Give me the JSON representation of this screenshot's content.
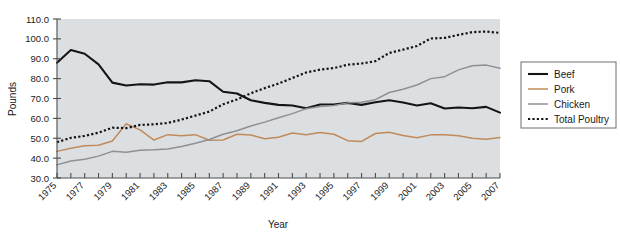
{
  "chart_data": {
    "type": "line",
    "title": "",
    "xlabel": "Year",
    "ylabel": "Pounds",
    "grid": false,
    "legend_position": "right",
    "xlim": [
      1975,
      2007
    ],
    "ylim": [
      30.0,
      110.0
    ],
    "ytick_step": 10.0,
    "ytick_labels": [
      "30.0",
      "40.0",
      "50.0",
      "60.0",
      "70.0",
      "80.0",
      "90.0",
      "100.0",
      "110.0"
    ],
    "ytick_values": [
      30.0,
      40.0,
      50.0,
      60.0,
      70.0,
      80.0,
      90.0,
      100.0,
      110.0
    ],
    "xtick_values": [
      1975,
      1976,
      1977,
      1978,
      1979,
      1980,
      1981,
      1982,
      1983,
      1984,
      1985,
      1986,
      1987,
      1988,
      1989,
      1990,
      1991,
      1992,
      1993,
      1994,
      1995,
      1996,
      1997,
      1998,
      1999,
      2000,
      2001,
      2002,
      2003,
      2004,
      2005,
      2006,
      2007
    ],
    "xtick_labels": [
      "1975",
      "",
      "1977",
      "",
      "1979",
      "",
      "1981",
      "",
      "1983",
      "",
      "1985",
      "",
      "1987",
      "",
      "1989",
      "",
      "1991",
      "",
      "1993",
      "",
      "1995",
      "",
      "1997",
      "",
      "1999",
      "",
      "2001",
      "",
      "2003",
      "",
      "2005",
      "",
      "2007"
    ],
    "x": [
      1975,
      1976,
      1977,
      1978,
      1979,
      1980,
      1981,
      1982,
      1983,
      1984,
      1985,
      1986,
      1987,
      1988,
      1989,
      1990,
      1991,
      1992,
      1993,
      1994,
      1995,
      1996,
      1997,
      1998,
      1999,
      2000,
      2001,
      2002,
      2003,
      2004,
      2005,
      2006,
      2007
    ],
    "series": [
      {
        "name": "Beef",
        "color": "#141414",
        "style": "solid",
        "width": 2.1,
        "values": [
          88.0,
          94.4,
          92.5,
          87.2,
          78.0,
          76.5,
          77.2,
          77.0,
          78.2,
          78.1,
          79.2,
          78.7,
          73.4,
          72.5,
          69.1,
          67.8,
          66.8,
          66.5,
          65.1,
          67.0,
          67.0,
          67.8,
          66.8,
          68.1,
          69.1,
          68.0,
          66.5,
          67.6,
          65.0,
          65.5,
          65.1,
          65.8,
          62.9
        ]
      },
      {
        "name": "Pork",
        "color": "#c08a5a",
        "style": "solid",
        "width": 1.5,
        "values": [
          43.4,
          45.0,
          46.2,
          46.5,
          48.6,
          57.3,
          54.2,
          49.1,
          51.8,
          51.2,
          51.8,
          49.0,
          49.1,
          52.0,
          51.6,
          49.8,
          50.5,
          52.6,
          51.8,
          52.9,
          52.0,
          48.8,
          48.4,
          52.4,
          53.0,
          51.4,
          50.3,
          51.7,
          51.7,
          51.3,
          50.0,
          49.5,
          50.4
        ]
      },
      {
        "name": "Chicken",
        "color": "#8e9093",
        "style": "solid",
        "width": 1.5,
        "values": [
          36.6,
          38.6,
          39.4,
          41.0,
          43.4,
          42.9,
          44.0,
          44.2,
          44.6,
          45.9,
          47.5,
          49.4,
          52.0,
          53.8,
          56.2,
          58.1,
          60.3,
          62.4,
          64.9,
          66.0,
          66.5,
          67.8,
          68.1,
          69.4,
          73.0,
          74.7,
          76.8,
          80.0,
          81.0,
          84.4,
          86.5,
          86.8,
          85.2
        ]
      },
      {
        "name": "Total Poultry",
        "color": "#141414",
        "style": "dotted",
        "width": 2.2,
        "values": [
          48.0,
          50.2,
          51.2,
          52.8,
          55.3,
          55.1,
          56.7,
          57.0,
          57.7,
          59.4,
          61.4,
          63.4,
          67.1,
          69.5,
          72.6,
          75.2,
          77.5,
          80.3,
          83.1,
          84.5,
          85.3,
          87.0,
          87.6,
          88.8,
          92.9,
          94.6,
          96.4,
          100.2,
          100.5,
          102.0,
          103.4,
          103.7,
          103.0
        ]
      }
    ]
  },
  "legend": {
    "items": [
      {
        "label": "Beef"
      },
      {
        "label": "Pork"
      },
      {
        "label": "Chicken"
      },
      {
        "label": "Total Poultry"
      }
    ]
  },
  "colors": {
    "plot_background": "#dcdfe2",
    "page_background": "#ffffff",
    "axis": "#4c4c4c",
    "text": "#1a1a1a",
    "legend_border": "#6e6e6e"
  }
}
